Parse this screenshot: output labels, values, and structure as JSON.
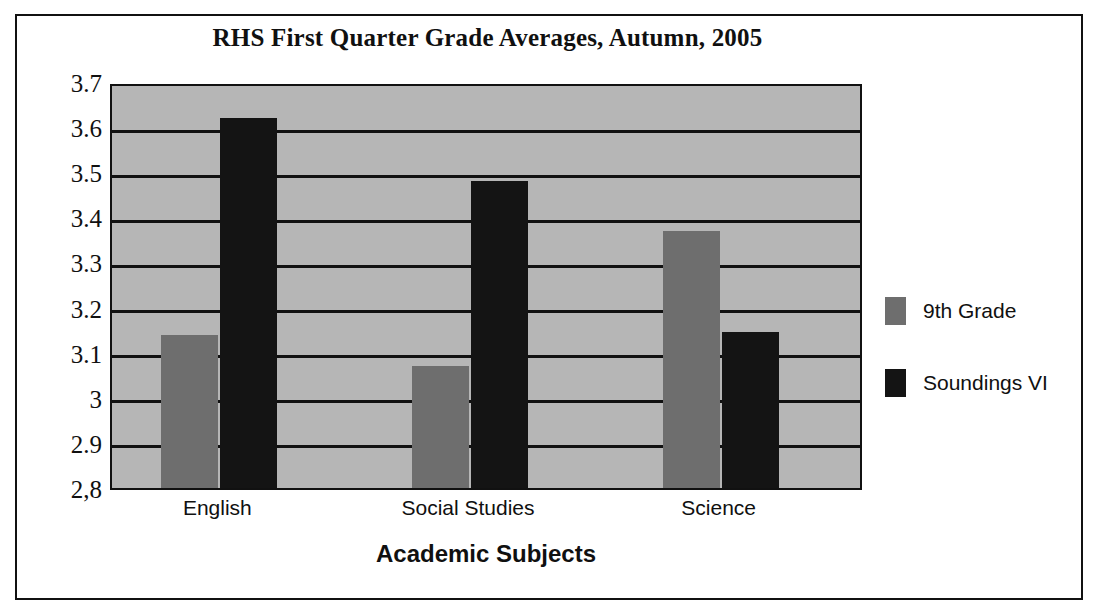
{
  "chart_data": {
    "type": "bar",
    "title": "RHS First Quarter Grade Averages, Autumn, 2005",
    "xlabel": "Academic Subjects",
    "ylabel": "",
    "categories": [
      "English",
      "Social Studies",
      "Science"
    ],
    "series": [
      {
        "name": "9th Grade",
        "color": "#6e6e6e",
        "values": [
          3.14,
          3.07,
          3.37
        ]
      },
      {
        "name": "Soundings VI",
        "color": "#141414",
        "values": [
          3.62,
          3.48,
          3.145
        ]
      }
    ],
    "ylim": [
      2.8,
      3.7
    ],
    "ytick_labels": [
      "3.7",
      "3.6",
      "3.5",
      "3.4",
      "3.3",
      "3.2",
      "3.1",
      "3",
      "2.9",
      "2,8"
    ],
    "ytick_values": [
      3.7,
      3.6,
      3.5,
      3.4,
      3.3,
      3.2,
      3.1,
      3.0,
      2.9,
      2.8
    ],
    "grid": true,
    "legend_position": "right",
    "plot_background": "#b6b6b6",
    "axis_color": "#111111"
  }
}
